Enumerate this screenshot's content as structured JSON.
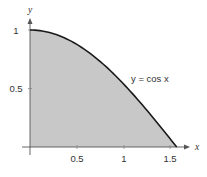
{
  "chart_data": {
    "type": "area",
    "title": "",
    "xlabel": "x",
    "ylabel": "y",
    "xlim": [
      0,
      1.5708
    ],
    "ylim": [
      0,
      1
    ],
    "grid": false,
    "legend": null,
    "x_ticks": [
      0.5,
      1,
      1.5
    ],
    "x_tick_labels": [
      "0.5",
      "1",
      "1.5"
    ],
    "y_ticks": [
      0.5,
      1
    ],
    "y_tick_labels": [
      "0.5",
      "1"
    ],
    "series": [
      {
        "name": "y = cos x",
        "function": "cos(x)",
        "x": [
          0,
          0.1,
          0.2,
          0.3,
          0.4,
          0.5,
          0.6,
          0.7,
          0.8,
          0.9,
          1.0,
          1.1,
          1.2,
          1.3,
          1.4,
          1.5,
          1.5708
        ],
        "values": [
          1.0,
          0.995,
          0.98,
          0.955,
          0.921,
          0.878,
          0.825,
          0.765,
          0.697,
          0.622,
          0.54,
          0.454,
          0.362,
          0.267,
          0.17,
          0.071,
          0.0
        ],
        "fill": "shaded area under curve down to x-axis"
      }
    ],
    "annotations": [
      {
        "text": "y = cos x",
        "x": 1.08,
        "y": 0.6
      }
    ],
    "colors": {
      "curve": "#1a1a1a",
      "fill": "#c8c8c8",
      "axes": "#555555"
    }
  },
  "labels": {
    "x_axis": "x",
    "y_axis": "y",
    "curve": "y = cos x",
    "xticks": [
      "0.5",
      "1",
      "1.5"
    ],
    "yticks": [
      "0.5",
      "1"
    ]
  }
}
